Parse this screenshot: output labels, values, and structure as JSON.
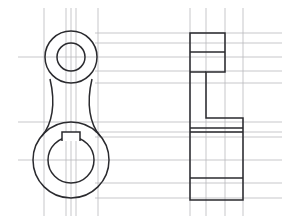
{
  "sheet": {
    "title": "Orthographic Two-View Engineering Drawing",
    "subtitle": "Connecting Arm / Crank Lever",
    "width": 294,
    "height": 224,
    "background_color": "#ffffff",
    "object_line_color": "#2a2a2e",
    "construction_line_color": "#b9b9bc"
  },
  "views": {
    "front": {
      "name": "Front View",
      "description": "Two bored circular bosses joined by a waisted web; keyway notch in lower bore"
    },
    "side": {
      "name": "Side View",
      "description": "Stepped thickness profile block"
    }
  },
  "geometry": {
    "front_view": {
      "upper_boss": {
        "name": "upper-boss",
        "center_x": 71,
        "center_y": 57,
        "outer_radius": 26,
        "inner_radius": 14
      },
      "lower_boss": {
        "name": "lower-boss",
        "center_x": 71,
        "center_y": 160,
        "outer_radius": 38,
        "inner_radius": 23
      },
      "web_left_path": "M 50 79 C 56 104 52 124 42 136",
      "web_right_path": "M 92 79 C 86 104 90 124 100 136",
      "keyway_path": "M 62 141 L 62 132 L 80 132 L 80 141"
    },
    "side_view": {
      "outline_path": "M 190 33 L 225 33 L 225 72 L 206 72 L 206 118 L 243 118 L 243 200 L 190 200 Z",
      "internal_lines": [
        {
          "name": "step-line-upper",
          "x1": 190,
          "y1": 52,
          "x2": 225,
          "y2": 52
        },
        {
          "name": "step-line-mid",
          "x1": 190,
          "y1": 72,
          "x2": 206,
          "y2": 72
        },
        {
          "name": "rib-line-upper",
          "x1": 190,
          "y1": 128,
          "x2": 243,
          "y2": 128
        },
        {
          "name": "rib-line-lower",
          "x1": 190,
          "y1": 132,
          "x2": 243,
          "y2": 132
        },
        {
          "name": "base-line",
          "x1": 190,
          "y1": 178,
          "x2": 243,
          "y2": 178
        }
      ]
    },
    "construction_lines": {
      "vertical": [
        {
          "name": "vline-front-left",
          "x": 44,
          "y1": 8,
          "y2": 216
        },
        {
          "name": "vline-front-centre-a",
          "x": 66,
          "y1": 8,
          "y2": 216
        },
        {
          "name": "vline-front-centre-b",
          "x": 71,
          "y1": 8,
          "y2": 216
        },
        {
          "name": "vline-front-centre-c",
          "x": 76,
          "y1": 8,
          "y2": 216
        },
        {
          "name": "vline-front-right",
          "x": 98,
          "y1": 8,
          "y2": 216
        },
        {
          "name": "vline-side-left",
          "x": 190,
          "y1": 8,
          "y2": 216
        },
        {
          "name": "vline-side-mid-a",
          "x": 206,
          "y1": 8,
          "y2": 216
        },
        {
          "name": "vline-side-mid-b",
          "x": 225,
          "y1": 8,
          "y2": 216
        },
        {
          "name": "vline-side-right",
          "x": 243,
          "y1": 8,
          "y2": 216
        }
      ],
      "horizontal": [
        {
          "name": "hline-top",
          "y": 33,
          "x1": 95,
          "x2": 282
        },
        {
          "name": "hline-upper-bore-top",
          "y": 43,
          "x1": 95,
          "x2": 282
        },
        {
          "name": "hline-upper-centre",
          "y": 57,
          "x1": 18,
          "x2": 282
        },
        {
          "name": "hline-upper-bore-bottom",
          "y": 71,
          "x1": 95,
          "x2": 282
        },
        {
          "name": "hline-upper-boss-bottom",
          "y": 83,
          "x1": 95,
          "x2": 282
        },
        {
          "name": "hline-web-lower",
          "y": 122,
          "x1": 18,
          "x2": 282
        },
        {
          "name": "hline-lower-boss-top",
          "y": 132,
          "x1": 95,
          "x2": 282
        },
        {
          "name": "hline-lower-bore-top",
          "y": 137,
          "x1": 95,
          "x2": 282
        },
        {
          "name": "hline-lower-centre",
          "y": 160,
          "x1": 18,
          "x2": 282
        },
        {
          "name": "hline-lower-bore-bottom",
          "y": 183,
          "x1": 95,
          "x2": 282
        },
        {
          "name": "hline-bottom",
          "y": 198,
          "x1": 95,
          "x2": 282
        }
      ]
    }
  }
}
